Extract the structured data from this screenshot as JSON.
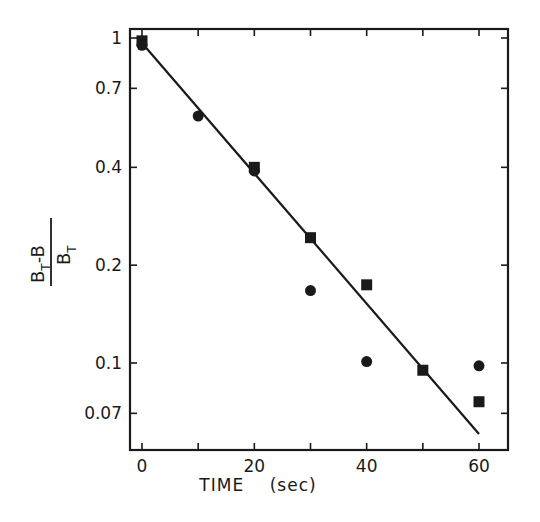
{
  "chart_data": {
    "type": "scatter",
    "title": "",
    "xlabel": "TIME (sec)",
    "ylabel": "(B_T - B) / B_T",
    "ylabel_parts": {
      "num_main": "B",
      "num_sub": "T",
      "num_rest": "-B",
      "den_main": "B",
      "den_sub": "T"
    },
    "xscale": "linear",
    "yscale": "log",
    "xlim": [
      -2,
      65
    ],
    "ylim": [
      0.052,
      1.07
    ],
    "x_ticks": [
      0,
      10,
      20,
      30,
      40,
      50,
      60
    ],
    "x_tick_labels": [
      "0",
      "20",
      "40",
      "60"
    ],
    "x_tick_label_values": [
      0,
      20,
      40,
      60
    ],
    "y_ticks": [
      1,
      0.7,
      0.4,
      0.2,
      0.1,
      0.07
    ],
    "y_tick_labels": [
      "1",
      "0.7",
      "0.4",
      "0.2",
      "0.1",
      "0.07"
    ],
    "grid": false,
    "legend": null,
    "series": [
      {
        "name": "squares",
        "marker": "square",
        "x": [
          0,
          20,
          30,
          40,
          50,
          60
        ],
        "y": [
          0.98,
          0.4,
          0.243,
          0.174,
          0.095,
          0.076
        ]
      },
      {
        "name": "circles",
        "marker": "circle",
        "x": [
          0,
          10,
          20,
          30,
          40,
          60
        ],
        "y": [
          0.95,
          0.575,
          0.39,
          0.167,
          0.101,
          0.098
        ]
      },
      {
        "name": "fit line",
        "marker": "line",
        "x": [
          0,
          60
        ],
        "y": [
          0.965,
          0.0605
        ]
      }
    ]
  },
  "labels": {
    "x_axis_title": "TIME    (sec)"
  }
}
